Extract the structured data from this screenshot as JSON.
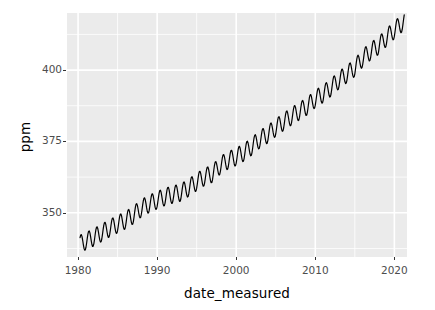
{
  "chart_data": {
    "type": "line",
    "title": "",
    "subtitle": "",
    "xlabel": "date_measured",
    "ylabel": "ppm",
    "xlim": [
      1978.6,
      2021.6
    ],
    "ylim": [
      334.5,
      420.0
    ],
    "grid": true,
    "legend": null,
    "x_ticks": [
      1980,
      1990,
      2000,
      2010,
      2020
    ],
    "x_tick_labels": [
      "1980",
      "1990",
      "2000",
      "2010",
      "2020"
    ],
    "x_minor_ticks": [
      1985,
      1995,
      2005,
      2015
    ],
    "y_ticks": [
      350,
      375,
      400
    ],
    "y_tick_labels": [
      "350",
      "375",
      "400"
    ],
    "y_minor_ticks": [
      337.5,
      362.5,
      387.5,
      412.5
    ],
    "series": [
      {
        "name": "CO2 (ppm)",
        "color": "#000000",
        "line_width": 1.2,
        "description": "Monthly mean atmospheric CO2 concentration with seasonal oscillation superimposed on a rising trend (Keeling curve).",
        "annual_mean": {
          "x": [
            1980,
            1981,
            1982,
            1983,
            1984,
            1985,
            1986,
            1987,
            1988,
            1989,
            1990,
            1991,
            1992,
            1993,
            1994,
            1995,
            1996,
            1997,
            1998,
            1999,
            2000,
            2001,
            2002,
            2003,
            2004,
            2005,
            2006,
            2007,
            2008,
            2009,
            2010,
            2011,
            2012,
            2013,
            2014,
            2015,
            2016,
            2017,
            2018,
            2019,
            2020,
            2021
          ],
          "y": [
            338.8,
            340.1,
            341.4,
            343.0,
            344.6,
            346.0,
            347.4,
            349.2,
            351.6,
            353.1,
            354.4,
            355.6,
            356.4,
            357.1,
            358.8,
            360.8,
            362.6,
            363.7,
            366.7,
            368.4,
            369.6,
            371.2,
            373.3,
            375.8,
            377.5,
            379.8,
            381.9,
            383.8,
            385.6,
            387.4,
            389.9,
            391.7,
            393.9,
            396.5,
            398.6,
            400.8,
            404.2,
            406.6,
            408.5,
            411.4,
            414.0,
            416.5
          ]
        },
        "seasonal_amplitude_ppm": 3.1,
        "seasonal_peak_month": 5,
        "seasonal_trough_month": 9,
        "value_at_start": 338.3,
        "value_at_end": 418.0,
        "n_points_per_year": 12
      }
    ],
    "panel_background": "#ebebeb",
    "gridline_color": "#ffffff",
    "tick_label_color": "#4d4d4d",
    "axis_title_color": "#000000"
  },
  "axes": {
    "y_title": "ppm",
    "x_title": "date_measured"
  }
}
